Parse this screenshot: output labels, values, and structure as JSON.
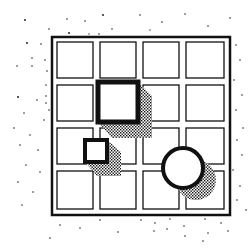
{
  "illustration": {
    "description": "Hand-drawn sketch of a 4x4 grid with a large square, a small square and a circle, each casting a stippled shadow toward the lower right, surrounded by scattered dots",
    "grid": {
      "rows": 4,
      "cols": 4,
      "x": 52,
      "y": 37,
      "size": 178,
      "cell": 44.5
    },
    "shapes": [
      {
        "type": "square",
        "label": "large-square",
        "x": 98,
        "y": 82,
        "w": 40,
        "h": 40
      },
      {
        "type": "square",
        "label": "small-square",
        "x": 85,
        "y": 140,
        "w": 22,
        "h": 22
      },
      {
        "type": "circle",
        "label": "circle",
        "cx": 183,
        "cy": 168,
        "r": 20
      }
    ],
    "colors": {
      "ink": "#111111",
      "paper": "#ffffff",
      "shadow": "#222222"
    }
  }
}
